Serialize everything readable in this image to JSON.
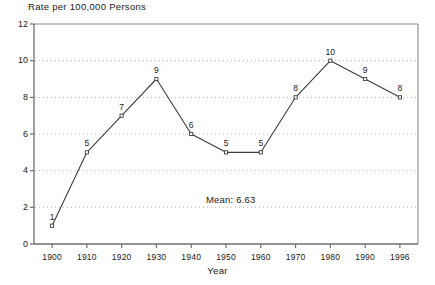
{
  "chart_data": {
    "type": "line",
    "title": "Rate per 100,000 Persons",
    "xlabel": "Year",
    "ylabel": "",
    "categories": [
      "1900",
      "1910",
      "1920",
      "1930",
      "1940",
      "1950",
      "1960",
      "1970",
      "1980",
      "1990",
      "1996"
    ],
    "values": [
      1,
      5,
      7,
      9,
      6,
      5,
      5,
      8,
      10,
      9,
      8
    ],
    "point_labels": [
      "1",
      "5",
      "7",
      "9",
      "6",
      "5",
      "5",
      "8",
      "10",
      "9",
      "8"
    ],
    "ylim": [
      0,
      12
    ],
    "yticks": [
      0,
      2,
      4,
      6,
      8,
      10,
      12
    ],
    "ytick_labels": [
      "0",
      "2",
      "4",
      "6",
      "8",
      "10",
      "12"
    ],
    "grid": true,
    "grid_style": "dotted-horizontal",
    "legend": "none",
    "marker": "open-square",
    "annotations": [
      {
        "text": "Mean: 6.63",
        "x": "1945",
        "y": 2.4
      }
    ],
    "colors": {
      "line": "#3c3c3c",
      "marker_edge": "#3c3c3c",
      "marker_fill": "#ffffff",
      "grid": "#b4b4b4",
      "axis": "#6e6e6e",
      "text": "#1a1a1a",
      "background": "#ffffff"
    }
  },
  "mean_value": "6.63"
}
